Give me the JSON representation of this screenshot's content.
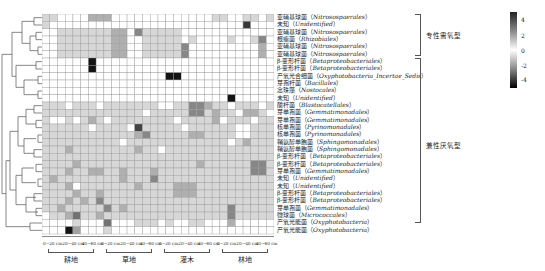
{
  "chart_data": {
    "type": "heatmap",
    "title": "",
    "xlabel": "",
    "ylabel": "",
    "column_groups": [
      {
        "label": "耕地",
        "depths": [
          "0~20 cm",
          "20~40 cm",
          "40~60 cm"
        ]
      },
      {
        "label": "草地",
        "depths": [
          "0~20 cm",
          "20~40 cm",
          "40~60 cm"
        ]
      },
      {
        "label": "灌木",
        "depths": [
          "0~20 cm",
          "20~40 cm",
          "40~60 cm"
        ]
      },
      {
        "label": "林地",
        "depths": [
          "0~20 cm",
          "20~40 cm",
          "40~60 cm"
        ]
      }
    ],
    "rows": [
      {
        "cn": "亚硝基球菌",
        "latin": "Nitrosospaerales"
      },
      {
        "cn": "未知",
        "latin": "Unidentified"
      },
      {
        "cn": "亚硝基球菌",
        "latin": "Nitrosospaerales"
      },
      {
        "cn": "根瘤菌",
        "latin": "Rhizobiales"
      },
      {
        "cn": "亚硝基球菌",
        "latin": "Nitrosospaerales"
      },
      {
        "cn": "亚硝基球菌",
        "latin": "Nitrosospaerales"
      },
      {
        "cn": "β-变形杆菌",
        "latin": "Betaproteobacteriales"
      },
      {
        "cn": "β-变形杆菌",
        "latin": "Betaproteobacteriales"
      },
      {
        "cn": "产氧光合细菌",
        "latin": "Oxyphotobacteria_Incertae_Sedis"
      },
      {
        "cn": "芽孢杆菌",
        "latin": "Bacillales"
      },
      {
        "cn": "念珠藻",
        "latin": "Nostocales"
      },
      {
        "cn": "未知",
        "latin": "Unidentified"
      },
      {
        "cn": "酸杆菌",
        "latin": "Blastocatellales"
      },
      {
        "cn": "芽单孢菌",
        "latin": "Gemmatimonadales"
      },
      {
        "cn": "芽单孢菌",
        "latin": "Gemmatimonadales"
      },
      {
        "cn": "核单孢菌",
        "latin": "Pyrinomonadales"
      },
      {
        "cn": "核单孢菌",
        "latin": "Pyrinomonadales"
      },
      {
        "cn": "鞘氨醇单胞菌",
        "latin": "Sphingomonadales"
      },
      {
        "cn": "鞘氨醇单胞菌",
        "latin": "Sphingomonadales"
      },
      {
        "cn": "β-变形杆菌",
        "latin": "Betaproteobacteriales"
      },
      {
        "cn": "β-变形杆菌",
        "latin": "Betaproteobacteriales"
      },
      {
        "cn": "芽单孢菌",
        "latin": "Gemmatimonadales"
      },
      {
        "cn": "未知",
        "latin": "Unidentified"
      },
      {
        "cn": "未知",
        "latin": "Unidentified"
      },
      {
        "cn": "β-变形杆菌",
        "latin": "Betaproteobacteriales"
      },
      {
        "cn": "β-变形杆菌",
        "latin": "Betaproteobacteriales"
      },
      {
        "cn": "芽单孢菌",
        "latin": "Gemmatimonadales"
      },
      {
        "cn": "微球菌",
        "latin": "Micrococcales"
      },
      {
        "cn": "产氧光能菌",
        "latin": "Oxyphotobacteria"
      },
      {
        "cn": "产氧光能菌",
        "latin": "Oxyphotobacteria"
      }
    ],
    "row_groups": [
      {
        "label": "专性需氧型",
        "start_row": 0,
        "end_row": 5
      },
      {
        "label": "兼性厌氧型",
        "start_row": 6,
        "end_row": 29
      }
    ],
    "colorbar": {
      "ticks": [
        4,
        2,
        0,
        -2,
        -4
      ],
      "range": [
        -5,
        5
      ],
      "colors": [
        "#222222",
        "#ffffff",
        "#000000"
      ]
    },
    "n_columns": 30,
    "values_note": "z-score intensities approximated from gray levels",
    "values": [
      [
        1,
        1,
        0,
        0,
        0,
        0,
        2,
        2,
        2,
        0,
        0,
        0,
        0,
        0,
        0,
        0,
        0,
        0,
        0,
        0,
        0,
        0,
        1,
        1,
        0,
        0,
        1,
        1,
        0,
        1
      ],
      [
        1,
        0,
        0,
        0,
        0,
        0,
        0,
        0,
        0,
        0,
        0,
        0,
        0,
        0,
        0,
        0,
        0,
        0,
        0,
        0,
        0,
        0,
        0,
        0,
        0,
        0,
        5,
        0,
        0,
        0
      ],
      [
        0,
        0,
        1,
        1,
        1,
        1,
        1,
        1,
        1,
        2,
        2,
        0,
        3,
        1,
        1,
        1,
        1,
        1,
        0,
        0,
        0,
        0,
        0,
        0,
        0,
        0,
        0,
        0,
        0,
        0
      ],
      [
        0,
        0,
        1,
        1,
        1,
        1,
        1,
        1,
        1,
        2,
        2,
        0,
        0,
        1,
        1,
        1,
        1,
        1,
        0,
        1,
        0,
        0,
        0,
        0,
        1,
        0,
        0,
        1,
        3,
        0
      ],
      [
        0,
        0,
        1,
        1,
        1,
        1,
        1,
        1,
        1,
        2,
        2,
        0,
        0,
        1,
        1,
        1,
        1,
        1,
        3,
        0,
        0,
        0,
        0,
        0,
        0,
        0,
        0,
        0,
        2,
        0
      ],
      [
        0,
        0,
        1,
        1,
        1,
        1,
        1,
        1,
        1,
        2,
        2,
        0,
        0,
        1,
        1,
        1,
        1,
        1,
        3,
        0,
        0,
        0,
        0,
        0,
        0,
        0,
        0,
        0,
        2,
        0
      ],
      [
        0,
        0,
        0,
        0,
        0,
        0,
        -5,
        0,
        0,
        0,
        0,
        0,
        0,
        0,
        0,
        0,
        0,
        0,
        0,
        0,
        0,
        0,
        0,
        0,
        0,
        0,
        0,
        0,
        0,
        0
      ],
      [
        0,
        0,
        0,
        0,
        0,
        0,
        -5,
        0,
        0,
        0,
        0,
        0,
        0,
        0,
        0,
        0,
        0,
        0,
        0,
        0,
        0,
        0,
        0,
        0,
        0,
        0,
        0,
        0,
        0,
        0
      ],
      [
        0,
        0,
        0,
        0,
        0,
        0,
        0,
        0,
        0,
        0,
        0,
        0,
        0,
        0,
        0,
        0,
        -5,
        -5,
        0,
        0,
        0,
        0,
        0,
        0,
        0,
        0,
        0,
        0,
        0,
        0
      ],
      [
        0,
        0,
        0,
        0,
        0,
        0,
        0,
        0,
        0,
        0,
        0,
        0,
        0,
        0,
        0,
        0,
        0,
        0,
        0,
        0,
        0,
        0,
        0,
        0,
        0,
        0,
        0,
        0,
        0,
        0
      ],
      [
        0,
        0,
        0,
        0,
        0,
        0,
        0,
        0,
        0,
        0,
        0,
        0,
        0,
        0,
        0,
        0,
        0,
        0,
        0,
        0,
        0,
        0,
        0,
        0,
        0,
        0,
        0,
        0,
        0,
        0
      ],
      [
        0,
        0,
        0,
        0,
        0,
        0,
        0,
        0,
        0,
        0,
        0,
        0,
        0,
        0,
        0,
        0,
        0,
        0,
        0,
        0,
        0,
        0,
        0,
        0,
        -5,
        0,
        0,
        0,
        0,
        0
      ],
      [
        1,
        1,
        1,
        0,
        1,
        1,
        1,
        0,
        1,
        1,
        1,
        1,
        1,
        1,
        1,
        0,
        0,
        1,
        1,
        3,
        3,
        2,
        1,
        1,
        0,
        1,
        1,
        1,
        0,
        1
      ],
      [
        1,
        1,
        1,
        1,
        1,
        1,
        1,
        1,
        1,
        1,
        1,
        1,
        1,
        0,
        1,
        1,
        1,
        1,
        1,
        3,
        3,
        1,
        2,
        1,
        1,
        0,
        2,
        2,
        1,
        0
      ],
      [
        1,
        0,
        0,
        1,
        0,
        1,
        2,
        1,
        0,
        1,
        1,
        1,
        1,
        1,
        1,
        1,
        1,
        0,
        1,
        1,
        1,
        1,
        2,
        0,
        1,
        1,
        1,
        0,
        1,
        1
      ],
      [
        1,
        1,
        1,
        1,
        1,
        1,
        0,
        1,
        1,
        1,
        1,
        0,
        -4,
        1,
        1,
        1,
        1,
        1,
        0,
        1,
        1,
        1,
        1,
        1,
        1,
        0,
        0,
        1,
        1,
        1
      ],
      [
        1,
        1,
        1,
        1,
        1,
        1,
        1,
        1,
        1,
        1,
        1,
        1,
        2,
        3,
        1,
        1,
        1,
        1,
        1,
        2,
        2,
        1,
        1,
        1,
        1,
        0,
        0,
        1,
        1,
        1
      ],
      [
        1,
        1,
        1,
        1,
        1,
        1,
        1,
        1,
        1,
        1,
        0,
        1,
        1,
        1,
        1,
        1,
        1,
        1,
        1,
        1,
        1,
        1,
        1,
        1,
        0,
        1,
        2,
        1,
        1,
        1
      ],
      [
        1,
        1,
        1,
        2,
        1,
        1,
        1,
        1,
        1,
        1,
        1,
        1,
        2,
        1,
        1,
        0,
        1,
        1,
        1,
        1,
        1,
        1,
        1,
        1,
        1,
        1,
        1,
        1,
        1,
        1
      ],
      [
        1,
        1,
        1,
        1,
        1,
        1,
        1,
        1,
        1,
        1,
        1,
        1,
        1,
        1,
        1,
        1,
        1,
        1,
        1,
        1,
        1,
        1,
        1,
        1,
        1,
        1,
        1,
        1,
        1,
        1
      ],
      [
        1,
        1,
        1,
        1,
        2,
        1,
        1,
        1,
        1,
        1,
        1,
        1,
        1,
        1,
        1,
        1,
        1,
        1,
        1,
        1,
        2,
        1,
        1,
        1,
        1,
        1,
        1,
        3,
        3,
        1
      ],
      [
        1,
        1,
        1,
        2,
        1,
        1,
        2,
        2,
        1,
        1,
        2,
        1,
        1,
        1,
        2,
        1,
        1,
        1,
        1,
        1,
        1,
        1,
        1,
        1,
        1,
        1,
        1,
        3,
        3,
        1
      ],
      [
        1,
        2,
        1,
        1,
        1,
        1,
        1,
        1,
        1,
        1,
        2,
        1,
        1,
        1,
        3,
        1,
        1,
        1,
        1,
        1,
        1,
        1,
        1,
        1,
        1,
        1,
        1,
        1,
        1,
        1
      ],
      [
        1,
        1,
        1,
        2,
        0,
        1,
        1,
        1,
        1,
        1,
        1,
        1,
        2,
        1,
        1,
        1,
        1,
        2,
        2,
        2,
        1,
        1,
        1,
        1,
        1,
        1,
        1,
        1,
        1,
        1
      ],
      [
        1,
        1,
        1,
        1,
        2,
        1,
        1,
        2,
        1,
        1,
        1,
        1,
        1,
        1,
        1,
        1,
        1,
        2,
        2,
        2,
        1,
        1,
        1,
        1,
        1,
        1,
        1,
        1,
        1,
        1
      ],
      [
        1,
        1,
        1,
        2,
        1,
        2,
        1,
        3,
        1,
        1,
        1,
        1,
        1,
        1,
        1,
        1,
        1,
        1,
        1,
        1,
        1,
        1,
        1,
        1,
        1,
        1,
        1,
        1,
        1,
        1
      ],
      [
        1,
        1,
        2,
        1,
        1,
        1,
        1,
        1,
        3,
        1,
        2,
        1,
        1,
        1,
        1,
        1,
        1,
        1,
        1,
        1,
        1,
        1,
        1,
        1,
        3,
        1,
        1,
        1,
        1,
        1
      ],
      [
        0,
        1,
        1,
        2,
        -3,
        1,
        1,
        2,
        1,
        1,
        1,
        1,
        1,
        1,
        1,
        1,
        1,
        1,
        1,
        1,
        1,
        1,
        1,
        1,
        3,
        1,
        1,
        1,
        1,
        1
      ],
      [
        0,
        0,
        0,
        0,
        1,
        0,
        0,
        0,
        -3,
        0,
        0,
        0,
        1,
        1,
        1,
        0,
        1,
        0,
        0,
        1,
        1,
        0,
        0,
        0,
        2,
        0,
        0,
        0,
        0,
        0
      ],
      [
        0,
        0,
        0,
        -5,
        -2,
        0,
        0,
        0,
        1,
        0,
        0,
        0,
        0,
        0,
        0,
        0,
        0,
        0,
        0,
        0,
        0,
        0,
        0,
        0,
        0,
        0,
        0,
        0,
        0,
        0
      ]
    ]
  },
  "labels": {
    "groups": [
      "耕地",
      "草地",
      "灌木",
      "林地"
    ],
    "depths": [
      "0~20 cm",
      "20~40 cm",
      "40~60 cm"
    ],
    "brace1": "专性需氧型",
    "brace2": "兼性厌氧型",
    "cb": [
      "4",
      "2",
      "0",
      "-2",
      "-4"
    ]
  }
}
